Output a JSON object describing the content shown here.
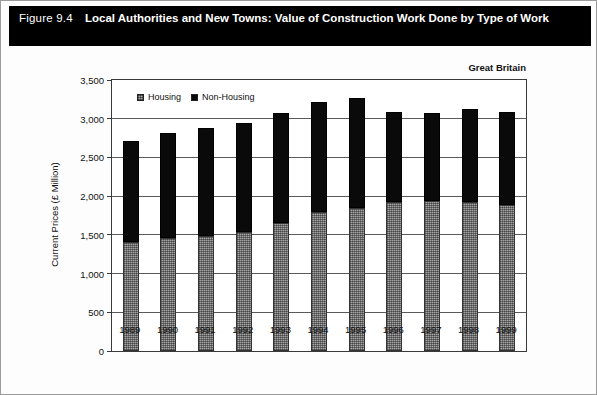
{
  "title": {
    "figure_number": "Figure 9.4",
    "text": "Local Authorities and New Towns: Value of Construction Work Done by Type of Work"
  },
  "region_label": "Great Britain",
  "legend": {
    "position": "inside-top-left",
    "items": [
      {
        "label": "Housing",
        "swatch": "hatched-gray-swatch",
        "color": "#a6a6a6"
      },
      {
        "label": "Non-Housing",
        "swatch": "solid-black-swatch",
        "color": "#0a0a0a"
      }
    ]
  },
  "chart_data": {
    "type": "bar",
    "stacked": true,
    "title": "Local Authorities and New Towns: Value of Construction Work Done by Type of Work",
    "subtitle": "Great Britain",
    "xlabel": "",
    "ylabel": "Current Prices (£ Million)",
    "ylim": [
      0,
      3500
    ],
    "yticks": [
      0,
      500,
      1000,
      1500,
      2000,
      2500,
      3000,
      3500
    ],
    "ytick_labels": [
      "0",
      "500",
      "1,000",
      "1,500",
      "2,000",
      "2,500",
      "3,000",
      "3,500"
    ],
    "grid": true,
    "grid_axis": "y",
    "legend_position": "upper left inside plot",
    "categories": [
      "1989",
      "1990",
      "1991",
      "1992",
      "1993",
      "1994",
      "1995",
      "1996",
      "1997",
      "1998",
      "1999"
    ],
    "series": [
      {
        "name": "Housing",
        "color": "#a6a6a6",
        "values": [
          1410,
          1460,
          1480,
          1540,
          1650,
          1790,
          1850,
          1930,
          1940,
          1930,
          1880
        ]
      },
      {
        "name": "Non-Housing",
        "color": "#0a0a0a",
        "values": [
          1300,
          1360,
          1400,
          1410,
          1430,
          1420,
          1420,
          1160,
          1130,
          1200,
          1210
        ]
      }
    ],
    "totals": [
      2710,
      2820,
      2880,
      2950,
      3080,
      3210,
      3270,
      3090,
      3070,
      3130,
      3090
    ]
  }
}
